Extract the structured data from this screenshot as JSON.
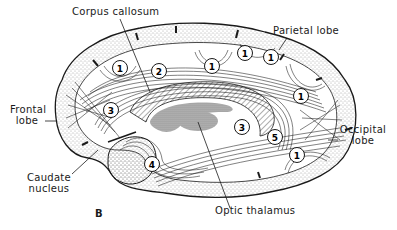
{
  "figure": {
    "panel_label": "B",
    "colors": {
      "ink": "#1a1a1a",
      "background": "#ffffff",
      "stipple": "#555555",
      "thalamus_fill": "#9a9a9a"
    }
  },
  "labels": {
    "corpus_callosum": "Corpus callosum",
    "parietal_lobe": "Parietal lobe",
    "frontal_lobe_line1": "Frontal",
    "frontal_lobe_line2": "lobe",
    "caudate_line1": "Caudate",
    "caudate_line2": "nucleus",
    "occipital_line1": "Occipital",
    "occipital_line2": "lobe",
    "optic_thalamus": "Optic thalamus"
  },
  "markers": [
    {
      "id": "m1a",
      "label": "1",
      "x": 120,
      "y": 68
    },
    {
      "id": "m1b",
      "label": "1",
      "x": 212,
      "y": 66
    },
    {
      "id": "m1c",
      "label": "1",
      "x": 245,
      "y": 53
    },
    {
      "id": "m1d",
      "label": "1",
      "x": 271,
      "y": 57
    },
    {
      "id": "m1e",
      "label": "1",
      "x": 301,
      "y": 96
    },
    {
      "id": "m1f",
      "label": "1",
      "x": 297,
      "y": 155
    },
    {
      "id": "m2",
      "label": "2",
      "x": 159,
      "y": 71
    },
    {
      "id": "m3a",
      "label": "3",
      "x": 111,
      "y": 110
    },
    {
      "id": "m3b",
      "label": "3",
      "x": 242,
      "y": 127
    },
    {
      "id": "m4",
      "label": "4",
      "x": 152,
      "y": 164
    },
    {
      "id": "m5",
      "label": "5",
      "x": 275,
      "y": 137
    }
  ]
}
